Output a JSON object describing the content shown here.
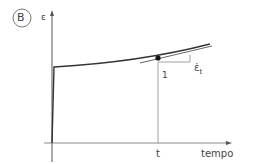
{
  "panel_label": "B",
  "y_axis_label": "ε",
  "x_axis_label": "tempo",
  "x_marker_label": "t",
  "slope_run_label": "1",
  "slope_rate_label": "ε̇",
  "slope_rate_subscript": "t",
  "colors": {
    "curve": "#333333",
    "axis": "#555555",
    "guide": "#888888",
    "badge_border": "#777777"
  }
}
